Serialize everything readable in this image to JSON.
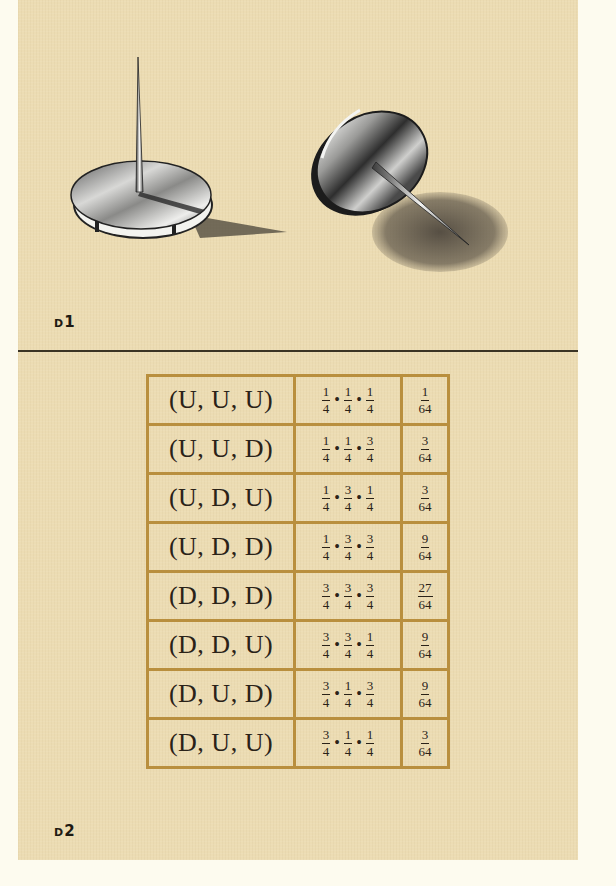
{
  "figures": {
    "d1": {
      "label_prefix": "D",
      "label_number": "1",
      "description": "Two thumbtacks: one landing point-up, one landing point-down"
    },
    "d2": {
      "label_prefix": "D",
      "label_number": "2"
    }
  },
  "table": {
    "columns": [
      "Outcome",
      "Product",
      "Probability"
    ],
    "rows": [
      {
        "outcome": "(U, U, U)",
        "factors": [
          [
            "1",
            "4"
          ],
          [
            "1",
            "4"
          ],
          [
            "1",
            "4"
          ]
        ],
        "result": [
          "1",
          "64"
        ]
      },
      {
        "outcome": "(U, U, D)",
        "factors": [
          [
            "1",
            "4"
          ],
          [
            "1",
            "4"
          ],
          [
            "3",
            "4"
          ]
        ],
        "result": [
          "3",
          "64"
        ]
      },
      {
        "outcome": "(U, D, U)",
        "factors": [
          [
            "1",
            "4"
          ],
          [
            "3",
            "4"
          ],
          [
            "1",
            "4"
          ]
        ],
        "result": [
          "3",
          "64"
        ]
      },
      {
        "outcome": "(U, D, D)",
        "factors": [
          [
            "1",
            "4"
          ],
          [
            "3",
            "4"
          ],
          [
            "3",
            "4"
          ]
        ],
        "result": [
          "9",
          "64"
        ]
      },
      {
        "outcome": "(D, D, D)",
        "factors": [
          [
            "3",
            "4"
          ],
          [
            "3",
            "4"
          ],
          [
            "3",
            "4"
          ]
        ],
        "result": [
          "27",
          "64"
        ]
      },
      {
        "outcome": "(D, D, U)",
        "factors": [
          [
            "3",
            "4"
          ],
          [
            "3",
            "4"
          ],
          [
            "1",
            "4"
          ]
        ],
        "result": [
          "9",
          "64"
        ]
      },
      {
        "outcome": "(D, U, D)",
        "factors": [
          [
            "3",
            "4"
          ],
          [
            "1",
            "4"
          ],
          [
            "3",
            "4"
          ]
        ],
        "result": [
          "9",
          "64"
        ]
      },
      {
        "outcome": "(D, U, U)",
        "factors": [
          [
            "3",
            "4"
          ],
          [
            "1",
            "4"
          ],
          [
            "1",
            "4"
          ]
        ],
        "result": [
          "3",
          "64"
        ]
      }
    ]
  },
  "symbols": {
    "multiply": "•"
  },
  "colors": {
    "panel": "#ecdcb3",
    "table_border": "#b98f3e",
    "text": "#2a2218",
    "divider": "#3b3424"
  }
}
